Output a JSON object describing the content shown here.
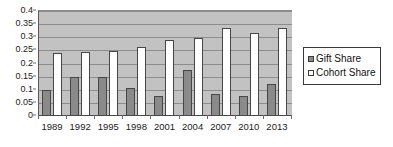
{
  "chart_data": {
    "type": "bar",
    "title": "",
    "subtitle": "",
    "xlabel": "",
    "ylabel": "",
    "categories": [
      "1989",
      "1992",
      "1995",
      "1998",
      "2001",
      "2004",
      "2007",
      "2010",
      "2013"
    ],
    "series": [
      {
        "name": "Gift Share",
        "color": "#8a8a8a",
        "values": [
          0.098,
          0.15,
          0.15,
          0.106,
          0.075,
          0.175,
          0.083,
          0.076,
          0.12
        ]
      },
      {
        "name": "Cohort Share",
        "color": "#ffffff",
        "values": [
          0.24,
          0.245,
          0.248,
          0.263,
          0.29,
          0.297,
          0.337,
          0.316,
          0.334
        ]
      }
    ],
    "ylim": [
      0,
      0.4
    ],
    "ytick_values": [
      0,
      0.05,
      0.1,
      0.15,
      0.2,
      0.25,
      0.3,
      0.35,
      0.4
    ],
    "ytick_labels": [
      "0",
      "0.05",
      "0.1",
      "0.15",
      "0.2",
      "0.25",
      "0.3",
      "0.35",
      "0.4"
    ],
    "grid": true,
    "grid_axis": "y",
    "legend_position": "right",
    "plot_background": "#c2c2c2",
    "figure_background": "#ffffff"
  },
  "legend": {
    "entries": [
      {
        "label": "Gift Share",
        "swatch": "filled-gray-square"
      },
      {
        "label": "Cohort Share",
        "swatch": "open-white-square"
      }
    ]
  }
}
